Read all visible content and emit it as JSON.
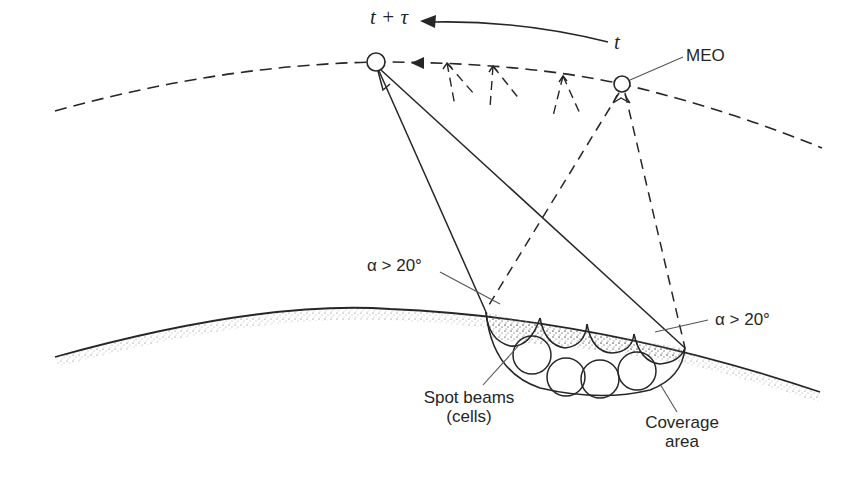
{
  "figure": {
    "labels": {
      "time_future": "t + τ",
      "time_now": "t",
      "satellite": "MEO",
      "elevation_left": "α > 20°",
      "elevation_right": "α > 20°",
      "spot_beams_line1": "Spot beams",
      "spot_beams_line2": "(cells)",
      "coverage_line1": "Coverage",
      "coverage_line2": "area"
    },
    "icons": {
      "satellite_future": "circle-satellite-icon",
      "satellite_now": "circle-satellite-icon",
      "motion_arrow": "arrow-left-icon",
      "orbit_arrow": "triangle-arrow-left-icon"
    },
    "colors": {
      "ink": "#262626",
      "stipple": "#6a6a6a",
      "background": "#ffffff"
    }
  }
}
